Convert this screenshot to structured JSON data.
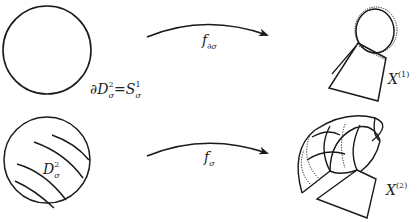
{
  "figure": {
    "top_row": {
      "domain_label": {
        "partial": "∂",
        "base": "D",
        "sup": "2",
        "sub": "σ",
        "equals": "=",
        "rhs_base": "S",
        "rhs_sup": "1",
        "rhs_sub": "σ"
      },
      "map_label": {
        "base": "f",
        "sub": "∂σ"
      },
      "target_label": {
        "base": "X",
        "sup": "(1)"
      }
    },
    "bottom_row": {
      "domain_label": {
        "base": "D",
        "sup": "2",
        "sub": "σ"
      },
      "map_label": {
        "base": "f",
        "sub": "σ"
      },
      "target_label": {
        "base": "X",
        "sup": "(2)"
      }
    },
    "colors": {
      "stroke": "#1a1a1a",
      "background": "#ffffff"
    }
  }
}
